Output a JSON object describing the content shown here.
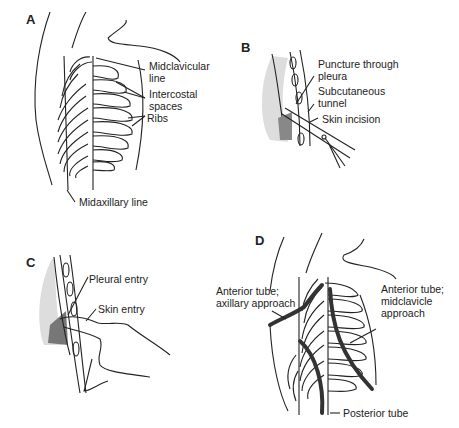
{
  "figure": {
    "panels": [
      {
        "id": "A",
        "label": "A",
        "annotations": [
          "Midclavicular line",
          "Intercostal spaces",
          "Ribs",
          "Midaxillary line"
        ]
      },
      {
        "id": "B",
        "label": "B",
        "annotations": [
          "Puncture through pleura",
          "Subcutaneous tunnel",
          "Skin incision"
        ]
      },
      {
        "id": "C",
        "label": "C",
        "annotations": [
          "Pleural entry",
          "Skin entry"
        ]
      },
      {
        "id": "D",
        "label": "D",
        "annotations": [
          "Anterior tube; axillary approach",
          "Anterior tube; midclavicle approach",
          "Posterior tube"
        ]
      }
    ]
  },
  "panelA": {
    "label": "A",
    "midclavicular": [
      "Midclavicular",
      "line"
    ],
    "intercostal": [
      "Intercostal",
      "spaces"
    ],
    "ribs": "Ribs",
    "midaxillary": "Midaxillary line",
    "rib_numbers": [
      "1",
      "2",
      "3",
      "4",
      "5",
      "6",
      "7",
      "8",
      "9",
      "10"
    ]
  },
  "panelB": {
    "label": "B",
    "puncture": [
      "Puncture through",
      "pleura"
    ],
    "tunnel": [
      "Subcutaneous",
      "tunnel"
    ],
    "incision": "Skin incision"
  },
  "panelC": {
    "label": "C",
    "pleural": "Pleural entry",
    "skin": "Skin entry"
  },
  "panelD": {
    "label": "D",
    "axillary": [
      "Anterior tube;",
      "axillary approach"
    ],
    "midclavicle": [
      "Anterior tube;",
      "midclavicle",
      "approach"
    ],
    "posterior": "Posterior tube"
  }
}
